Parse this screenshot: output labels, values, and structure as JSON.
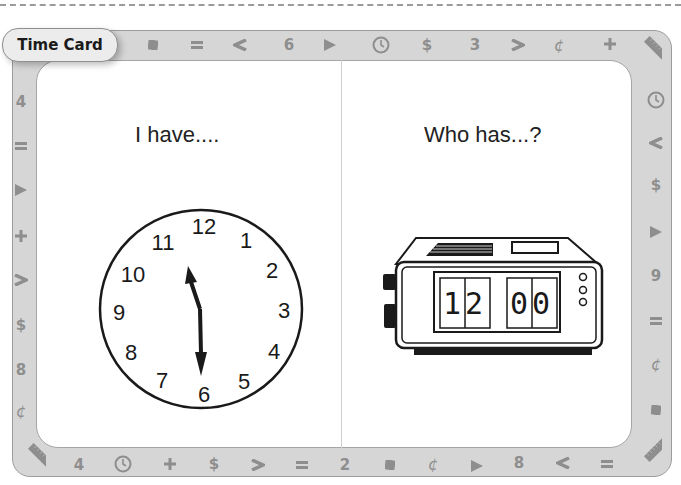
{
  "card": {
    "title": "Time Card",
    "left_prompt": "I have....",
    "right_prompt": "Who has...?"
  },
  "analog_clock": {
    "numbers": [
      "12",
      "1",
      "2",
      "3",
      "4",
      "5",
      "6",
      "7",
      "8",
      "9",
      "10",
      "11"
    ],
    "time": "11:30",
    "hour_hand_points_to": "between 11 and 12",
    "minute_hand_points_to": "6"
  },
  "digital_clock": {
    "hours": "12",
    "minutes": "00"
  },
  "border": {
    "top": [
      "square",
      "=",
      "<",
      "6",
      "triangle",
      "clock",
      "$",
      "3",
      ">",
      "¢",
      "+",
      "ruler"
    ],
    "right": [
      "clock",
      "<",
      "$",
      "triangle",
      "9",
      "=",
      "¢",
      "square"
    ],
    "bottom": [
      "ruler",
      "4",
      "clock",
      "+",
      "$",
      ">",
      "=",
      "2",
      "square",
      "¢",
      "triangle",
      "8",
      "<",
      "=",
      "ruler"
    ],
    "left": [
      "4",
      "=",
      "triangle",
      "+",
      ">",
      "$",
      "8",
      "¢"
    ]
  },
  "colors": {
    "frame": "#d6d6d6",
    "symbol": "#8e8e8e",
    "ink": "#1a1a1a"
  }
}
